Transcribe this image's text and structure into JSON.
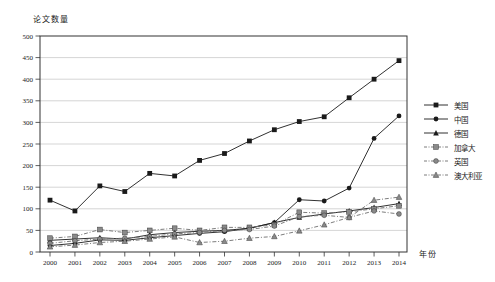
{
  "page": {
    "background": "#ffffff",
    "frame_color": "#333333",
    "grid_color": "#aaaaaa",
    "text_color": "#1a1a1a"
  },
  "chart_data": {
    "type": "line",
    "title": "",
    "ylabel": "论文数量",
    "xlabel": "年份",
    "x": [
      2000,
      2001,
      2002,
      2003,
      2004,
      2005,
      2006,
      2007,
      2008,
      2009,
      2010,
      2011,
      2012,
      2013,
      2014
    ],
    "ylim": [
      0,
      500
    ],
    "ytick_step": 50,
    "grid": true,
    "legend_position": "right",
    "series": [
      {
        "id": "usa",
        "name": "美国",
        "marker": "square",
        "line": "solid",
        "line_color": "#1a1a1a",
        "marker_fill": "#1a1a1a",
        "values": [
          120,
          95,
          153,
          140,
          182,
          176,
          212,
          228,
          257,
          283,
          302,
          313,
          357,
          400,
          443
        ]
      },
      {
        "id": "china",
        "name": "中国",
        "marker": "circle",
        "line": "solid",
        "line_color": "#1a1a1a",
        "marker_fill": "#1a1a1a",
        "values": [
          15,
          20,
          28,
          27,
          33,
          38,
          43,
          47,
          55,
          68,
          121,
          118,
          148,
          263,
          315
        ]
      },
      {
        "id": "germany",
        "name": "德国",
        "marker": "triangle",
        "line": "solid",
        "line_color": "#1a1a1a",
        "marker_fill": "#1a1a1a",
        "values": [
          27,
          30,
          33,
          30,
          40,
          45,
          48,
          50,
          55,
          68,
          80,
          88,
          95,
          103,
          112
        ]
      },
      {
        "id": "canada",
        "name": "加拿大",
        "marker": "square",
        "line": "dashed",
        "line_color": "#6e6e6e",
        "marker_fill": "#8a8a8a",
        "values": [
          32,
          36,
          52,
          45,
          50,
          55,
          50,
          57,
          57,
          63,
          92,
          90,
          93,
          100,
          107
        ]
      },
      {
        "id": "uk",
        "name": "英国",
        "marker": "circle",
        "line": "dashed",
        "line_color": "#6e6e6e",
        "marker_fill": "#8a8a8a",
        "values": [
          20,
          26,
          30,
          32,
          36,
          42,
          45,
          50,
          52,
          60,
          82,
          85,
          80,
          95,
          88
        ]
      },
      {
        "id": "australia",
        "name": "澳大利亚",
        "marker": "triangle",
        "line": "dashed",
        "line_color": "#6e6e6e",
        "marker_fill": "#8a8a8a",
        "values": [
          12,
          16,
          22,
          25,
          30,
          35,
          22,
          25,
          32,
          36,
          49,
          63,
          80,
          120,
          127
        ]
      }
    ]
  }
}
